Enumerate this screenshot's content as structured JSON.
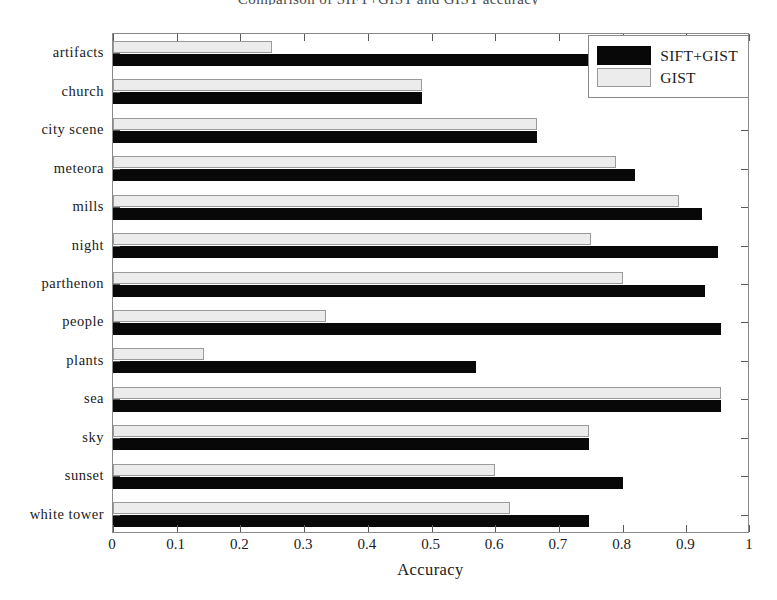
{
  "title": "Comparison of SIFT+GIST and GIST accuracy",
  "legend": {
    "position": "top-right",
    "entries": [
      {
        "label": "SIFT+GIST",
        "color": "#080808",
        "swatch": "black-filled-swatch"
      },
      {
        "label": "GIST",
        "color": "#ececec",
        "swatch": "light-gray-swatch"
      }
    ]
  },
  "axes": {
    "xlabel": "Accuracy",
    "ylabel": "",
    "xticks": [
      "0",
      "0.1",
      "0.2",
      "0.3",
      "0.4",
      "0.5",
      "0.6",
      "0.7",
      "0.8",
      "0.9",
      "1"
    ],
    "xlim": [
      0,
      1
    ],
    "grid": false
  },
  "chart_data": {
    "type": "bar",
    "orientation": "horizontal",
    "title": "Comparison of SIFT+GIST and GIST accuracy",
    "xlabel": "Accuracy",
    "ylabel": "",
    "xlim": [
      0,
      1
    ],
    "grid": false,
    "legend_position": "upper right",
    "categories": [
      "artifacts",
      "church",
      "city scene",
      "meteora",
      "mills",
      "night",
      "parthenon",
      "people",
      "plants",
      "sea",
      "sky",
      "sunset",
      "white tower"
    ],
    "series": [
      {
        "name": "SIFT+GIST",
        "color": "#080808",
        "values": [
          0.75,
          0.485,
          0.665,
          0.82,
          0.925,
          0.95,
          0.93,
          0.955,
          0.57,
          0.955,
          0.748,
          0.8,
          0.748
        ]
      },
      {
        "name": "GIST",
        "color": "#ececec",
        "values": [
          0.25,
          0.485,
          0.665,
          0.79,
          0.888,
          0.75,
          0.8,
          0.335,
          0.143,
          0.955,
          0.748,
          0.6,
          0.623
        ]
      }
    ]
  }
}
